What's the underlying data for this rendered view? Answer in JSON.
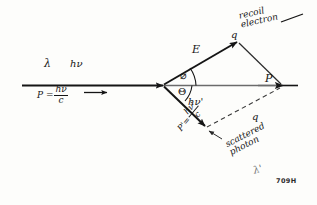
{
  "figure": {
    "plate_number": "709H",
    "ink_color": "#151515",
    "axis_color": "#6b6b6b",
    "background": "#fdfdfb"
  },
  "labels": {
    "lambda": "λ",
    "h_nu": "hν",
    "momentum_prefix": "P =",
    "momentum_numerator": "hν",
    "momentum_denominator": "c",
    "phi": "⌀",
    "theta": "Θ",
    "energy_vector": "E",
    "q_vertex": "q",
    "P_vector": "P",
    "q_dashed": "q",
    "h_nu_prime": "hν'",
    "recoil_line1": "recoil",
    "recoil_line2": "electron",
    "scattered_line1": "scattered",
    "scattered_line2": "photon",
    "p_prime_prefix": "P'=",
    "p_prime_numerator": "hν'",
    "p_prime_denominator": "c",
    "lambda_prime": "λ'"
  }
}
